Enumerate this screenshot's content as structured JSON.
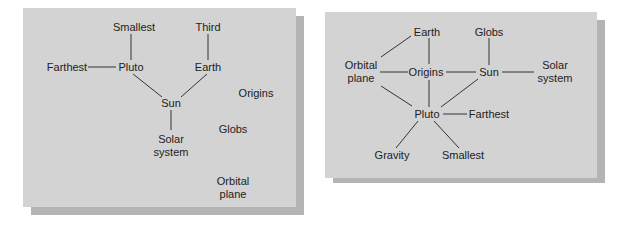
{
  "diagrams": [
    {
      "id": "left",
      "nodes": [
        {
          "id": "smallest",
          "label": "Smallest",
          "x": 134,
          "y": 27
        },
        {
          "id": "third",
          "label": "Third",
          "x": 208,
          "y": 27
        },
        {
          "id": "farthest",
          "label": "Farthest",
          "x": 67,
          "y": 67
        },
        {
          "id": "pluto",
          "label": "Pluto",
          "x": 131,
          "y": 67
        },
        {
          "id": "earth",
          "label": "Earth",
          "x": 208,
          "y": 67
        },
        {
          "id": "sun",
          "label": "Sun",
          "x": 171,
          "y": 103
        },
        {
          "id": "solar",
          "label": "Solar\nsystem",
          "x": 171,
          "y": 146
        },
        {
          "id": "origins",
          "label": "Origins",
          "x": 256,
          "y": 93
        },
        {
          "id": "globs",
          "label": "Globs",
          "x": 233,
          "y": 129
        },
        {
          "id": "orbital",
          "label": "Orbital\nplane",
          "x": 233,
          "y": 188
        }
      ],
      "edges": [
        [
          131,
          34,
          131,
          60
        ],
        [
          88,
          67,
          116,
          67
        ],
        [
          133,
          74,
          162,
          97
        ],
        [
          208,
          34,
          208,
          60
        ],
        [
          207,
          74,
          181,
          97
        ],
        [
          171,
          110,
          171,
          130
        ]
      ]
    },
    {
      "id": "right",
      "nodes": [
        {
          "id": "earth",
          "label": "Earth",
          "x": 427,
          "y": 32
        },
        {
          "id": "globs",
          "label": "Globs",
          "x": 489,
          "y": 32
        },
        {
          "id": "orbital",
          "label": "Orbital\nplane",
          "x": 361,
          "y": 72
        },
        {
          "id": "origins",
          "label": "Origins",
          "x": 426,
          "y": 72
        },
        {
          "id": "sun",
          "label": "Sun",
          "x": 489,
          "y": 72
        },
        {
          "id": "solar",
          "label": "Solar\nsystem",
          "x": 555,
          "y": 72
        },
        {
          "id": "pluto",
          "label": "Pluto",
          "x": 427,
          "y": 114
        },
        {
          "id": "farthest",
          "label": "Farthest",
          "x": 489,
          "y": 114
        },
        {
          "id": "gravity",
          "label": "Gravity",
          "x": 392,
          "y": 155
        },
        {
          "id": "smallest",
          "label": "Smallest",
          "x": 463,
          "y": 155
        }
      ],
      "edges": [
        [
          411,
          36,
          381,
          57
        ],
        [
          429,
          38,
          429,
          64
        ],
        [
          380,
          72,
          408,
          72
        ],
        [
          446,
          72,
          476,
          72
        ],
        [
          502,
          72,
          534,
          72
        ],
        [
          489,
          38,
          489,
          65
        ],
        [
          429,
          80,
          429,
          107
        ],
        [
          381,
          86,
          412,
          106
        ],
        [
          478,
          79,
          441,
          107
        ],
        [
          443,
          114,
          467,
          114
        ],
        [
          418,
          121,
          396,
          148
        ],
        [
          434,
          121,
          459,
          148
        ]
      ]
    }
  ],
  "panels": [
    {
      "x": 23,
      "y": 8,
      "w": 273,
      "h": 199
    },
    {
      "x": 325,
      "y": 12,
      "w": 272,
      "h": 166
    }
  ],
  "colors": {
    "panel": "#d3d3d3",
    "shadow": "#b4b4b4",
    "ink": "#222222",
    "line": "#333333"
  }
}
